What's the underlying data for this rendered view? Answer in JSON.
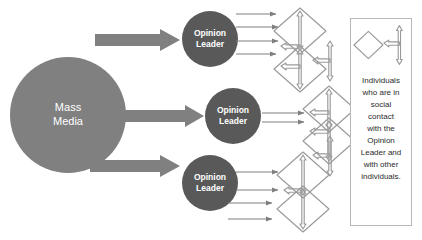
{
  "diagram": {
    "source": {
      "label": "Mass Media",
      "lines": [
        "Mass",
        "Media"
      ],
      "shape": "circle",
      "color": "#808080",
      "text_color": "#ffffff"
    },
    "opinion_leaders": [
      {
        "id": "ol-1",
        "label": "Opinion Leader",
        "lines": [
          "Opinion",
          "Leader"
        ],
        "followers": 4
      },
      {
        "id": "ol-2",
        "label": "Opinion Leader",
        "lines": [
          "Opinion",
          "Leader"
        ],
        "followers": 2
      },
      {
        "id": "ol-3",
        "label": "Opinion Leader",
        "lines": [
          "Opinion",
          "Leader"
        ],
        "followers": 4
      }
    ],
    "opinion_leader_style": {
      "shape": "circle",
      "color": "#595959",
      "text_color": "#ffffff"
    },
    "media_arrows": {
      "count": 3,
      "style": "thick-block-arrow",
      "color": "#808080",
      "direction": "left-to-right"
    },
    "influence_arrows": {
      "style": "thin-line-arrow",
      "color": "#7f7f7f",
      "direction": "left-to-right"
    },
    "individual_nodes": {
      "shape": "diamond",
      "outline_color": "#9a9a9a",
      "fill": "none",
      "connector": "double-headed-arrow"
    },
    "legend": {
      "icons": [
        {
          "name": "diamond-icon",
          "meaning": "individual"
        },
        {
          "name": "double-headed-arrow-icon",
          "meaning": "social contact"
        }
      ],
      "text": "Individuals who are in social contact with the Opinion Leader and with other individuals.",
      "lines": [
        "Individuals",
        "who are in",
        "social",
        "contact",
        "with the",
        "Opinion",
        "Leader and",
        "with other",
        "individuals."
      ],
      "border_color": "#b8b8b8"
    },
    "colors": {
      "background": "#ffffff",
      "mass_media": "#808080",
      "opinion_leader": "#595959",
      "arrow_gray": "#7f7f7f",
      "outline_gray": "#9a9a9a",
      "legend_border": "#b8b8b8",
      "text_dark": "#2b2b2b"
    }
  }
}
